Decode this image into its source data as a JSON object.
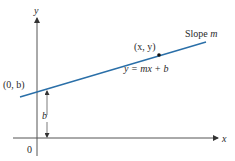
{
  "diagram": {
    "axes": {
      "x_label": "x",
      "y_label": "y",
      "origin_label": "0"
    },
    "line": {
      "color": "#2a6fa8",
      "equation_label": "y = mx + b",
      "slope_label_prefix": "Slope ",
      "slope_label_var": "m"
    },
    "points": {
      "intercept_label": "(0, b)",
      "general_point_label": "(x, y)"
    },
    "intercept_distance_label": "b"
  }
}
